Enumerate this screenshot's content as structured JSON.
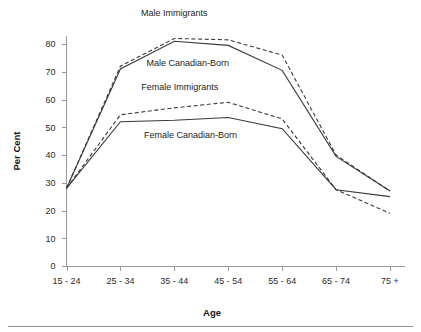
{
  "chart_data": {
    "type": "line",
    "title": "",
    "xlabel": "Age",
    "ylabel": "Per Cent",
    "categories": [
      "15 - 24",
      "25 - 34",
      "35 - 44",
      "45 - 54",
      "55 - 64",
      "65 - 74",
      "75 +"
    ],
    "ylim": [
      0,
      85
    ],
    "yticks": [
      0,
      10,
      20,
      30,
      40,
      50,
      60,
      70,
      80
    ],
    "ytick_labels": [
      "0",
      "10",
      "20",
      "30",
      "40",
      "50",
      "60",
      "70",
      "80"
    ],
    "grid": false,
    "legend_position": "inline-annotations",
    "series": [
      {
        "name": "Male Immigrants",
        "style": "dashed",
        "values": [
          28,
          72,
          82,
          81.5,
          76,
          40,
          27
        ]
      },
      {
        "name": "Male Canadian-Born",
        "style": "solid",
        "values": [
          28,
          71,
          81,
          79.5,
          70.5,
          39.5,
          27
        ]
      },
      {
        "name": "Female Immigrants",
        "style": "dashed",
        "values": [
          28,
          54.5,
          57,
          59,
          53,
          27.5,
          19
        ]
      },
      {
        "name": "Female Canadian-Born",
        "style": "solid",
        "values": [
          28,
          52,
          52.5,
          53.5,
          49.5,
          27.5,
          25
        ]
      }
    ],
    "annotations": [
      {
        "text": "Male Immigrants",
        "x_category_index": 2.0,
        "y_value": 90
      },
      {
        "text": "Male Canadian-Born",
        "x_category_index": 2.25,
        "y_value": 72
      },
      {
        "text": "Female Immigrants",
        "x_category_index": 2.1,
        "y_value": 63.5
      },
      {
        "text": "Female Canadian-Born",
        "x_category_index": 2.3,
        "y_value": 46
      }
    ]
  }
}
